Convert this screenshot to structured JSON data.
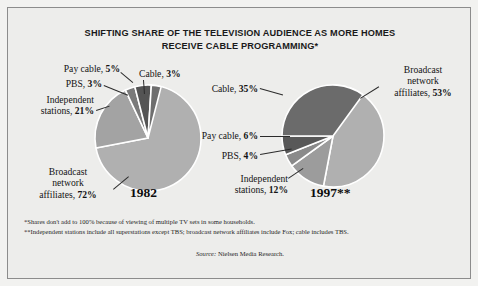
{
  "figure": {
    "title_line1": "SHIFTING SHARE OF THE TELEVISION AUDIENCE AS MORE HOMES",
    "title_line2": "RECEIVE CABLE PROGRAMMING*",
    "footnote1": "*Shares don't add to 100% because of viewing of multiple TV sets in some households.",
    "footnote2": "**Independent stations include all superstations except TBS; broadcast network affiliates include Fox; cable includes TBS.",
    "source_label": "Source:",
    "source_text": " Nielsen Media Research.",
    "border_color": "#8c8c8c",
    "background_color": "#ededeb"
  },
  "chart_data": {
    "type": "pie",
    "title": "SHIFTING SHARE OF THE TELEVISION AUDIENCE AS MORE HOMES RECEIVE CABLE PROGRAMMING*",
    "legend_position": "callout-labels",
    "charts": [
      {
        "name": "1982",
        "year_label": "1982",
        "slices": [
          {
            "label": "Broadcast network affiliates",
            "value": 72,
            "value_text": "72%",
            "color": "#b0b0b0"
          },
          {
            "label": "Independent stations",
            "value": 21,
            "value_text": "21%",
            "color": "#a3a3a3"
          },
          {
            "label": "PBS",
            "value": 3,
            "value_text": "3%",
            "color": "#7a7a7a"
          },
          {
            "label": "Pay cable",
            "value": 5,
            "value_text": "5%",
            "color": "#545454"
          },
          {
            "label": "Cable",
            "value": 3,
            "value_text": "3%",
            "color": "#6e6e6e"
          }
        ]
      },
      {
        "name": "1997",
        "year_label": "1997**",
        "slices": [
          {
            "label": "Broadcast network affiliates",
            "value": 53,
            "value_text": "53%",
            "color": "#b0b0b0"
          },
          {
            "label": "Independent stations",
            "value": 12,
            "value_text": "12%",
            "color": "#9c9c9c"
          },
          {
            "label": "PBS",
            "value": 4,
            "value_text": "4%",
            "color": "#8a8a8a"
          },
          {
            "label": "Pay cable",
            "value": 6,
            "value_text": "6%",
            "color": "#585858"
          },
          {
            "label": "Cable",
            "value": 35,
            "value_text": "35%",
            "color": "#6b6b6b"
          }
        ]
      }
    ]
  },
  "labels_1982": {
    "pay_cable": "Pay cable, ",
    "pay_cable_val": "5%",
    "pbs": "PBS, ",
    "pbs_val": "3%",
    "cable": "Cable, ",
    "cable_val": "3%",
    "independent_l1": "Independent",
    "independent_l2": "stations, ",
    "independent_val": "21%",
    "broadcast_l1": "Broadcast",
    "broadcast_l2": "network",
    "broadcast_l3": "affiliates, ",
    "broadcast_val": "72%",
    "year": "1982"
  },
  "labels_1997": {
    "cable": "Cable, ",
    "cable_val": "35%",
    "pay_cable": "Pay cable, ",
    "pay_cable_val": "6%",
    "pbs": "PBS, ",
    "pbs_val": "4%",
    "independent_l1": "Independent",
    "independent_l2": "stations, ",
    "independent_val": "12%",
    "broadcast_l1": "Broadcast",
    "broadcast_l2": "network",
    "broadcast_l3": "affiliates, ",
    "broadcast_val": "53%",
    "year": "1997**"
  }
}
